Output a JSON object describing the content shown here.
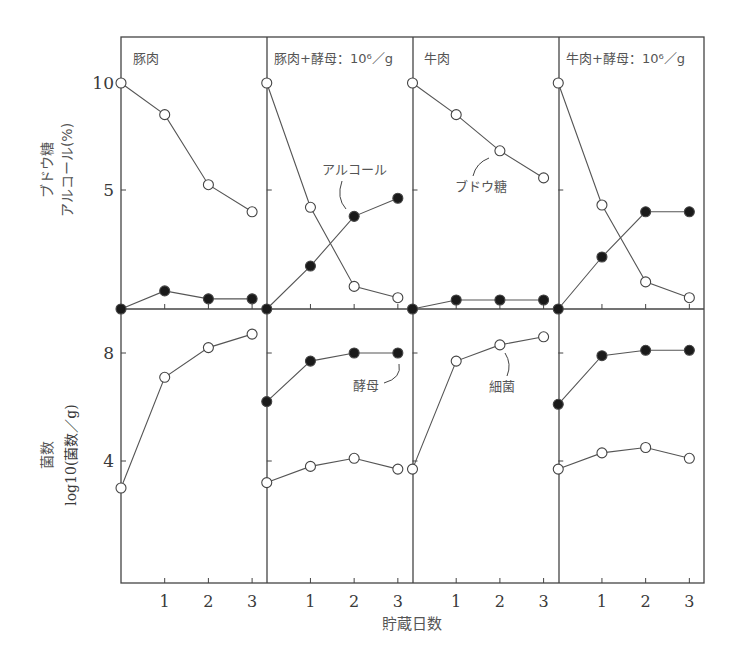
{
  "chart_data": {
    "type": "line",
    "xlabel": "貯蔵日数",
    "x": [
      0,
      1,
      2,
      3
    ],
    "x_tick_labels": [
      "1",
      "2",
      "3"
    ],
    "panels": [
      {
        "title": "豚肉",
        "top": {
          "ylabel": [
            "ブドウ糖",
            "アルコール(%)"
          ],
          "yticks": [
            5,
            10
          ],
          "ylim": [
            0,
            10
          ],
          "series": [
            {
              "name": "ブドウ糖",
              "marker": "open",
              "values": [
                10,
                8.6,
                5.5,
                4.3
              ]
            },
            {
              "name": "アルコール",
              "marker": "filled",
              "values": [
                0,
                0.8,
                0.45,
                0.45
              ]
            }
          ]
        },
        "bottom": {
          "ylabel": [
            "菌数",
            "log10(菌数／g)"
          ],
          "yticks": [
            4,
            8
          ],
          "series": [
            {
              "name": "細菌",
              "marker": "open",
              "values": [
                3.0,
                7.1,
                8.2,
                8.7
              ]
            }
          ]
        }
      },
      {
        "title": "豚肉+酵母：10⁶／g",
        "top": {
          "series": [
            {
              "name": "ブドウ糖",
              "marker": "open",
              "values": [
                10,
                4.5,
                1.0,
                0.5
              ]
            },
            {
              "name": "アルコール",
              "marker": "filled",
              "values": [
                0,
                1.9,
                4.1,
                4.9
              ]
            }
          ],
          "annotation": "アルコール"
        },
        "bottom": {
          "series": [
            {
              "name": "酵母",
              "marker": "filled",
              "values": [
                6.2,
                7.7,
                8.0,
                8.0
              ]
            },
            {
              "name": "細菌",
              "marker": "open",
              "values": [
                3.2,
                3.8,
                4.1,
                3.7
              ]
            }
          ],
          "annotation": "酵母"
        }
      },
      {
        "title": "牛肉",
        "top": {
          "series": [
            {
              "name": "ブドウ糖",
              "marker": "open",
              "values": [
                10,
                8.6,
                7.0,
                5.8
              ]
            },
            {
              "name": "アルコール",
              "marker": "filled",
              "values": [
                0,
                0.4,
                0.4,
                0.4
              ]
            }
          ],
          "annotation": "ブドウ糖"
        },
        "bottom": {
          "series": [
            {
              "name": "細菌",
              "marker": "open",
              "values": [
                3.7,
                7.7,
                8.3,
                8.6
              ]
            }
          ],
          "annotation": "細菌"
        }
      },
      {
        "title": "牛肉+酵母：10⁶／g",
        "top": {
          "series": [
            {
              "name": "ブドウ糖",
              "marker": "open",
              "values": [
                10,
                4.6,
                1.2,
                0.5
              ]
            },
            {
              "name": "アルコール",
              "marker": "filled",
              "values": [
                0,
                2.3,
                4.3,
                4.3
              ]
            }
          ]
        },
        "bottom": {
          "series": [
            {
              "name": "酵母",
              "marker": "filled",
              "values": [
                6.1,
                7.9,
                8.1,
                8.1
              ]
            },
            {
              "name": "細菌",
              "marker": "open",
              "values": [
                3.7,
                4.3,
                4.5,
                4.1
              ]
            }
          ]
        }
      }
    ]
  },
  "labels": {
    "top_ylabel_line1": "ブドウ糖",
    "top_ylabel_line2": "アルコール(%)",
    "bottom_ylabel_line1": "菌数",
    "bottom_ylabel_line2": "log10(菌数／g)",
    "xlabel": "貯蔵日数",
    "tick_10": "10",
    "tick_5": "5",
    "tick_8": "8",
    "tick_4": "4",
    "panel_titles": [
      "豚肉",
      "豚肉+酵母：10⁶／g",
      "牛肉",
      "牛肉+酵母：10⁶／g"
    ],
    "annotations": {
      "alcohol": "アルコール",
      "glucose": "ブドウ糖",
      "yeast": "酵母",
      "bacteria": "細菌"
    }
  }
}
